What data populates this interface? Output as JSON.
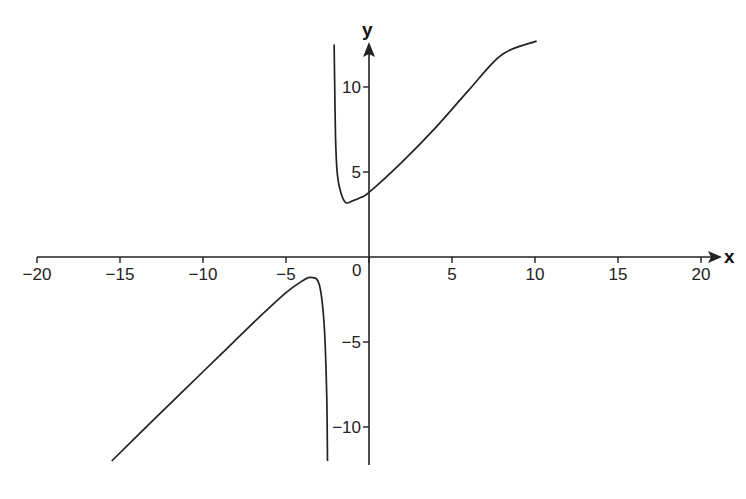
{
  "chart_data": {
    "type": "line",
    "title": "",
    "xlabel": "x",
    "ylabel": "y",
    "xlim": [
      -20,
      21
    ],
    "ylim": [
      -12.5,
      13.5
    ],
    "x_ticks": [
      -20,
      -15,
      -10,
      -5,
      0,
      5,
      10,
      15,
      20
    ],
    "x_tick_labels": [
      "−20",
      "−15",
      "−10",
      "−5",
      "0",
      "5",
      "10",
      "15",
      "20"
    ],
    "y_ticks": [
      10,
      5,
      -5,
      -10
    ],
    "y_tick_labels": [
      "10",
      "5",
      "−5",
      "−10"
    ],
    "grid": false,
    "legend": null,
    "series": [
      {
        "name": "upper branch",
        "x": [
          -2.1,
          -2.05,
          -2.0,
          -1.9,
          -1.7,
          -1.4,
          -1.0,
          -0.5,
          0,
          2,
          4,
          6,
          8,
          10.1
        ],
        "y": [
          12.5,
          9.0,
          6.5,
          4.8,
          3.8,
          3.2,
          3.3,
          3.5,
          3.8,
          5.6,
          7.6,
          9.8,
          11.9,
          12.7
        ]
      },
      {
        "name": "lower branch",
        "x": [
          -15.5,
          -13,
          -11,
          -9,
          -7,
          -5,
          -4,
          -3.5,
          -3.0,
          -2.7,
          -2.55,
          -2.5
        ],
        "y": [
          -12.0,
          -9.6,
          -7.7,
          -5.8,
          -3.9,
          -2.1,
          -1.4,
          -1.2,
          -1.6,
          -4.0,
          -8.0,
          -12.0
        ]
      }
    ],
    "annotations": []
  }
}
